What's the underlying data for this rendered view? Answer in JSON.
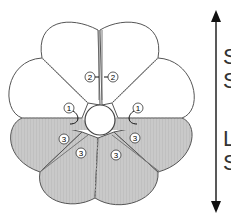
{
  "diagram": {
    "colors": {
      "petal_fill_top": "#ffffff",
      "petal_fill_bottom": "#c8c8c8",
      "outline": "#555555",
      "seam": "#999999",
      "arrow": "#111111"
    },
    "markers": [
      {
        "id": "m2-left",
        "label": "2"
      },
      {
        "id": "m2-right",
        "label": "2"
      },
      {
        "id": "m1-left",
        "label": "1"
      },
      {
        "id": "m1-right",
        "label": "1"
      },
      {
        "id": "m3-left-a",
        "label": "3"
      },
      {
        "id": "m3-left-b",
        "label": "3"
      },
      {
        "id": "m3-right-a",
        "label": "3"
      },
      {
        "id": "m3-right-b",
        "label": "3"
      }
    ],
    "side_labels": {
      "upper_1": "S",
      "upper_2": "S",
      "lower_1": "L",
      "lower_2": "S"
    }
  }
}
